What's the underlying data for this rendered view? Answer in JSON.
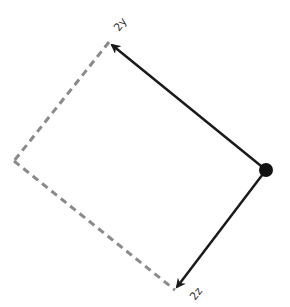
{
  "diagram": {
    "type": "vector-parallelogram",
    "origin": {
      "x": 266,
      "y": 170
    },
    "vectors": [
      {
        "label": "2y",
        "tip": {
          "x": 109,
          "y": 42
        },
        "style": "solid-arrow",
        "color": "#1a1a1a"
      },
      {
        "label": "2z",
        "tip": {
          "x": 175,
          "y": 290
        },
        "style": "solid-arrow",
        "color": "#1a1a1a"
      }
    ],
    "completion_corner": {
      "x": 14,
      "y": 161
    },
    "dashed_color": "#8a8a8a"
  },
  "labels": {
    "y_vector": "2y",
    "z_vector": "2z"
  }
}
